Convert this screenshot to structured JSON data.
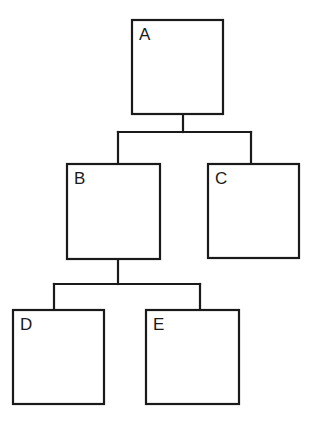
{
  "diagram": {
    "type": "tree",
    "stroke_color": "#1a1a1a",
    "stroke_width": 2.2,
    "nodes": [
      {
        "id": "A",
        "label": "A",
        "x": 132,
        "y": 20,
        "w": 91,
        "h": 94
      },
      {
        "id": "B",
        "label": "B",
        "x": 67,
        "y": 164,
        "w": 93,
        "h": 95
      },
      {
        "id": "C",
        "label": "C",
        "x": 208,
        "y": 164,
        "w": 91,
        "h": 94
      },
      {
        "id": "D",
        "label": "D",
        "x": 13,
        "y": 310,
        "w": 91,
        "h": 94
      },
      {
        "id": "E",
        "label": "E",
        "x": 146,
        "y": 310,
        "w": 93,
        "h": 94
      }
    ],
    "edges": [
      {
        "from": "A",
        "to": "B"
      },
      {
        "from": "A",
        "to": "C"
      },
      {
        "from": "B",
        "to": "D"
      },
      {
        "from": "B",
        "to": "E"
      }
    ],
    "connectors": [
      {
        "parent": "A",
        "stem_x": 183,
        "bus_y": 132,
        "children_x": [
          118,
          251
        ]
      },
      {
        "parent": "B",
        "stem_x": 118,
        "bus_y": 284,
        "children_x": [
          54,
          200
        ]
      }
    ]
  }
}
